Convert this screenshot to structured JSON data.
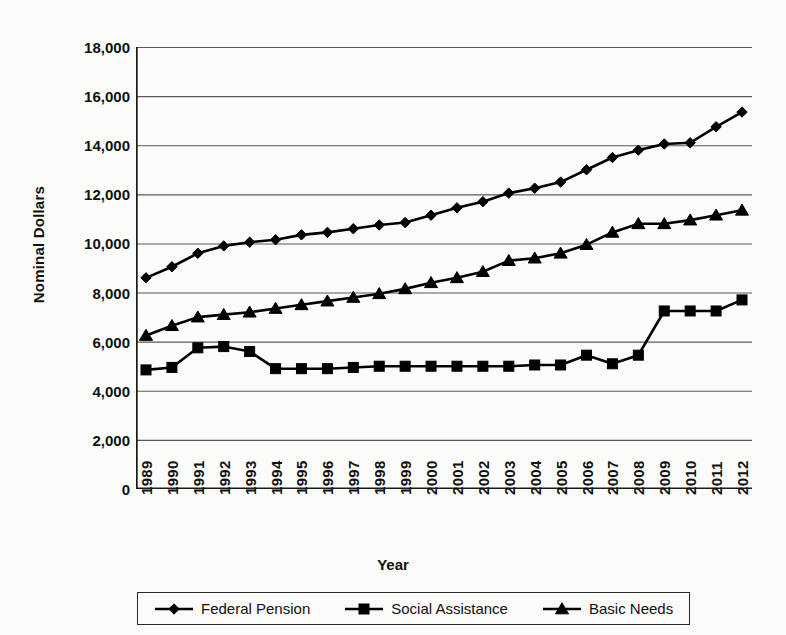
{
  "chart_data": {
    "type": "line",
    "title": "",
    "xlabel": "Year",
    "ylabel": "Nominal Dollars",
    "ylim": [
      0,
      18000
    ],
    "yticks": [
      "0",
      "2,000",
      "4,000",
      "6,000",
      "8,000",
      "10,000",
      "12,000",
      "14,000",
      "16,000",
      "18,000"
    ],
    "ytick_values": [
      0,
      2000,
      4000,
      6000,
      8000,
      10000,
      12000,
      14000,
      16000,
      18000
    ],
    "grid": "horizontal",
    "legend_position": "bottom",
    "categories": [
      "1989",
      "1990",
      "1991",
      "1992",
      "1993",
      "1994",
      "1995",
      "1996",
      "1997",
      "1998",
      "1999",
      "2000",
      "2001",
      "2002",
      "2003",
      "2004",
      "2005",
      "2006",
      "2007",
      "2008",
      "2009",
      "2010",
      "2011",
      "2012"
    ],
    "series": [
      {
        "name": "Federal Pension",
        "marker": "diamond",
        "color": "#000000",
        "values": [
          8600,
          9050,
          9600,
          9900,
          10050,
          10150,
          10350,
          10450,
          10600,
          10750,
          10850,
          11150,
          11450,
          11700,
          12050,
          12250,
          12500,
          13000,
          13500,
          13800,
          14050,
          14100,
          14750,
          15350
        ]
      },
      {
        "name": "Social Assistance",
        "marker": "square",
        "color": "#000000",
        "values": [
          4850,
          4950,
          5750,
          5800,
          5600,
          4900,
          4900,
          4900,
          4950,
          5000,
          5000,
          5000,
          5000,
          5000,
          5000,
          5050,
          5050,
          5450,
          5100,
          5450,
          7250,
          7250,
          7250,
          7700
        ]
      },
      {
        "name": "Basic Needs",
        "marker": "triangle",
        "color": "#000000",
        "values": [
          6250,
          6650,
          7000,
          7100,
          7200,
          7350,
          7500,
          7650,
          7800,
          7950,
          8150,
          8400,
          8600,
          8850,
          9300,
          9400,
          9600,
          9950,
          10450,
          10800,
          10800,
          10950,
          11150,
          11350
        ]
      }
    ]
  },
  "axis": {
    "y_title": "Nominal Dollars",
    "x_title": "Year"
  },
  "legend": {
    "items": [
      {
        "label": "Federal Pension",
        "marker": "diamond-marker-icon"
      },
      {
        "label": "Social Assistance",
        "marker": "square-marker-icon"
      },
      {
        "label": "Basic Needs",
        "marker": "triangle-marker-icon"
      }
    ]
  }
}
